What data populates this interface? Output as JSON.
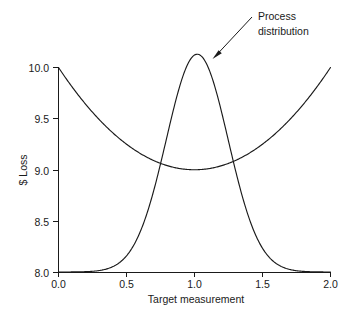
{
  "chart_data": {
    "type": "line",
    "title": "",
    "xlabel": "Target measurement",
    "ylabel": "$ Loss",
    "xlim": [
      0.0,
      2.0
    ],
    "ylim": [
      8.0,
      10.0
    ],
    "grid": false,
    "legend_position": "none",
    "xticks": [
      "0.0",
      "0.5",
      "1.0",
      "1.5",
      "2.0"
    ],
    "xtick_values": [
      0.0,
      0.5,
      1.0,
      1.5,
      2.0
    ],
    "yticks": [
      "8.0",
      "8.5",
      "9.0",
      "9.5",
      "10.0"
    ],
    "ytick_values": [
      8.0,
      8.5,
      9.0,
      9.5,
      10.0
    ],
    "series": [
      {
        "name": "Quadratic loss function",
        "type": "line",
        "formula": "L(x) = 9.0 + (x - 1.0)^2",
        "vertex": [
          1.0,
          9.0
        ],
        "x": [
          0.0,
          0.1,
          0.2,
          0.3,
          0.4,
          0.5,
          0.6,
          0.7,
          0.8,
          0.9,
          1.0,
          1.1,
          1.2,
          1.3,
          1.4,
          1.5,
          1.6,
          1.7,
          1.8,
          1.9,
          2.0
        ],
        "values": [
          10.0,
          9.81,
          9.64,
          9.49,
          9.36,
          9.25,
          9.16,
          9.09,
          9.04,
          9.01,
          9.0,
          9.01,
          9.04,
          9.09,
          9.16,
          9.25,
          9.36,
          9.49,
          9.64,
          9.81,
          10.0
        ]
      },
      {
        "name": "Process distribution",
        "type": "line",
        "formula": "f(x) = 8.0 + 2.13 * exp(-((x - 1.02)^2) / (2 * 0.228^2))",
        "peak": [
          1.02,
          10.13
        ],
        "baseline": 8.0,
        "mean": 1.02,
        "sigma": 0.228,
        "x": [
          0.0,
          0.1,
          0.2,
          0.3,
          0.4,
          0.5,
          0.6,
          0.7,
          0.8,
          0.9,
          1.0,
          1.1,
          1.2,
          1.3,
          1.4,
          1.5,
          1.6,
          1.7,
          1.8,
          1.9,
          2.0
        ],
        "values": [
          8.0,
          8.0,
          8.0,
          8.01,
          8.03,
          8.1,
          8.26,
          8.6,
          9.14,
          9.74,
          10.12,
          10.07,
          9.6,
          8.95,
          8.41,
          8.13,
          8.03,
          8.0,
          8.0,
          8.0,
          8.0
        ]
      }
    ],
    "annotations": [
      {
        "name": "process-distribution-callout",
        "line1": "Process",
        "line2": "distribution",
        "text": "Process distribution",
        "points_to": [
          1.13,
          10.07
        ]
      }
    ]
  },
  "colors": {
    "ink": "#1a1a1a",
    "background": "#ffffff"
  }
}
